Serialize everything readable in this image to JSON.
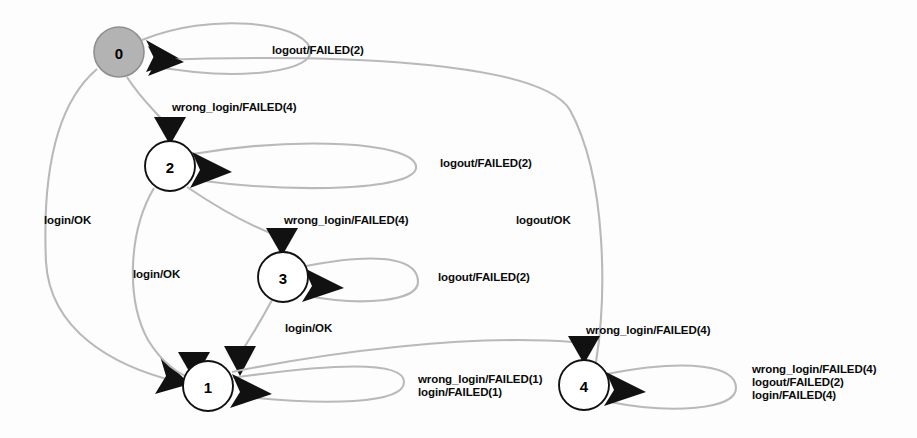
{
  "diagram": {
    "type": "finite-state-machine",
    "edge_color": "#b9b9b9",
    "node_fill": "#ffffff",
    "initial_node_fill": "#b3b3b3",
    "arrow_color": "#111111"
  },
  "states": [
    {
      "id": "0",
      "label": "0",
      "cx": 119,
      "cy": 52,
      "r": 25,
      "initial": true
    },
    {
      "id": "2",
      "label": "2",
      "cx": 170,
      "cy": 166,
      "r": 25,
      "initial": false
    },
    {
      "id": "3",
      "label": "3",
      "cx": 283,
      "cy": 277,
      "r": 25,
      "initial": false
    },
    {
      "id": "1",
      "label": "1",
      "cx": 208,
      "cy": 386,
      "r": 25,
      "initial": false
    },
    {
      "id": "4",
      "label": "4",
      "cx": 584,
      "cy": 385,
      "r": 25,
      "initial": false
    }
  ],
  "transitions": [
    {
      "from": "0",
      "to": "0",
      "label": "logout/FAILED(2)",
      "label_x": 272,
      "label_y": 44
    },
    {
      "from": "0",
      "to": "2",
      "label": "wrong_login/FAILED(4)",
      "label_x": 172,
      "label_y": 101
    },
    {
      "from": "2",
      "to": "2",
      "label": "logout/FAILED(2)",
      "label_x": 440,
      "label_y": 157
    },
    {
      "from": "2",
      "to": "3",
      "label": "wrong_login/FAILED(4)",
      "label_x": 284,
      "label_y": 214
    },
    {
      "from": "3",
      "to": "3",
      "label": "logout/FAILED(2)",
      "label_x": 438,
      "label_y": 271
    },
    {
      "from": "0",
      "to": "1",
      "label": "login/OK",
      "label_x": 44,
      "label_y": 214
    },
    {
      "from": "2",
      "to": "1",
      "label": "login/OK",
      "label_x": 133,
      "label_y": 268
    },
    {
      "from": "3",
      "to": "1",
      "label": "login/OK",
      "label_x": 285,
      "label_y": 322
    },
    {
      "from": "4",
      "to": "0",
      "label": "logout/OK",
      "label_x": 516,
      "label_y": 214
    },
    {
      "from": "1",
      "to": "4",
      "label": "wrong_login/FAILED(4)",
      "label_x": 586,
      "label_y": 324
    },
    {
      "from": "1",
      "to": "1",
      "label": "wrong_login/FAILED(1)\nlogin/FAILED(1)",
      "label_x": 418,
      "label_y": 373
    },
    {
      "from": "4",
      "to": "4",
      "label": "wrong_login/FAILED(4)\nlogout/FAILED(2)\nlogin/FAILED(4)",
      "label_x": 752,
      "label_y": 363
    }
  ]
}
